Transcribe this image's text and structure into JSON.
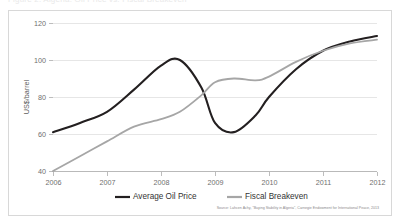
{
  "title_strip": {
    "ghost_text": "Figure 2. Algeria: Oil Price vs. Fiscal Breakeven"
  },
  "chart_data": {
    "type": "line",
    "title": "",
    "xlabel": "",
    "ylabel": "US$/barrel",
    "xlim": [
      2006,
      2012
    ],
    "ylim": [
      40,
      120
    ],
    "yticks": [
      40,
      60,
      80,
      100,
      120
    ],
    "xticks": [
      "2006",
      "2007",
      "2008",
      "2009",
      "2010",
      "2011",
      "2012"
    ],
    "grid": true,
    "legend_position": "bottom-center",
    "x": [
      2006,
      2006.5,
      2007,
      2007.5,
      2008,
      2008.35,
      2008.75,
      2009,
      2009.35,
      2009.75,
      2010,
      2010.5,
      2011,
      2011.5,
      2012
    ],
    "series": [
      {
        "name": "Average Oil Price",
        "color": "#231f20",
        "values": [
          61,
          66,
          72,
          84,
          97,
          100,
          85,
          66,
          61,
          70,
          80,
          95,
          105,
          110,
          113
        ]
      },
      {
        "name": "Fiscal Breakeven",
        "color": "#a6a6a6",
        "values": [
          40,
          48,
          56,
          64,
          68,
          72,
          81,
          88,
          90,
          89,
          91,
          99,
          105,
          109,
          111
        ]
      }
    ],
    "source": "Source: Lahcen Achy, \"Buying Stability in Algeria\", Carnegie Endowment for International Peace, 2013"
  }
}
